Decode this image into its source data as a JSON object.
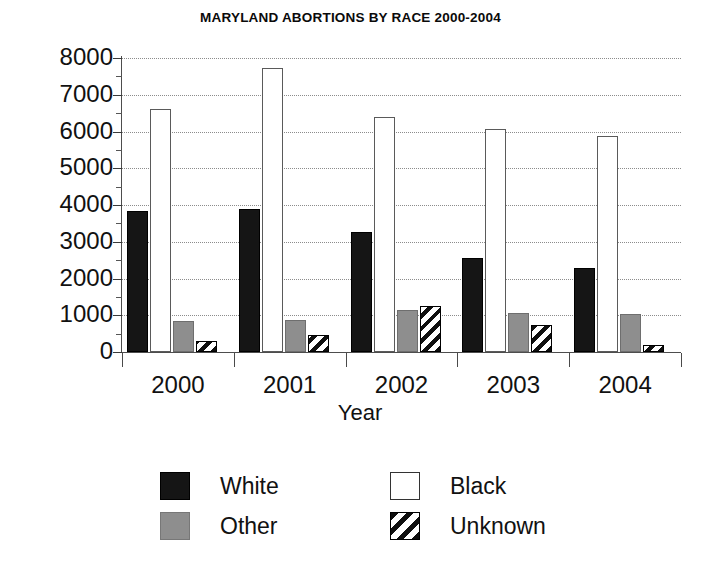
{
  "chart_data": {
    "type": "bar",
    "title": "MARYLAND ABORTIONS BY RACE 2000-2004",
    "xlabel": "Year",
    "ylabel": "",
    "categories": [
      "2000",
      "2001",
      "2002",
      "2003",
      "2004"
    ],
    "ylim": [
      0,
      8000
    ],
    "ytick_labels": [
      "8000",
      "7000",
      "6000",
      "5000",
      "4000",
      "3000",
      "2000",
      "1000",
      "0"
    ],
    "ytick_values": [
      8000,
      7000,
      6000,
      5000,
      4000,
      3000,
      2000,
      1000,
      0
    ],
    "ytick_minor_values": [
      7500,
      6500,
      5500,
      4500,
      3500,
      2500,
      1500,
      500
    ],
    "grid": true,
    "grid_style": "dotted",
    "legend_position": "bottom",
    "series": [
      {
        "name": "White",
        "fill": "solid-black",
        "color": "#151515",
        "values": [
          3830,
          3900,
          3270,
          2570,
          2290
        ]
      },
      {
        "name": "Black",
        "fill": "open-white",
        "color": "#ffffff",
        "values": [
          6600,
          7720,
          6390,
          6070,
          5890
        ]
      },
      {
        "name": "Other",
        "fill": "solid-gray",
        "color": "#8e8e8e",
        "values": [
          840,
          870,
          1150,
          1050,
          1030
        ]
      },
      {
        "name": "Unknown",
        "fill": "diagonal-hatch",
        "color": "#0f0f0f",
        "values": [
          300,
          470,
          1250,
          740,
          200
        ]
      }
    ]
  },
  "legend": {
    "items": [
      {
        "label": "White",
        "swatch": "sw-white-race"
      },
      {
        "label": "Black",
        "swatch": "sw-black-race"
      },
      {
        "label": "Other",
        "swatch": "sw-other-race"
      },
      {
        "label": "Unknown",
        "swatch": "sw-unknown-race"
      }
    ]
  }
}
